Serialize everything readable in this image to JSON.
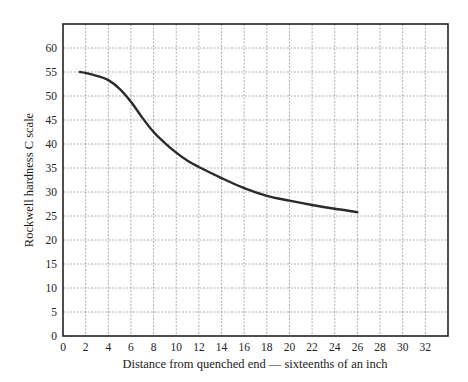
{
  "chart_data": {
    "type": "line",
    "title": "",
    "xlabel": "Distance from quenched end — sixteenths of an inch",
    "ylabel": "Rockwell hardness C scale",
    "xlim": [
      0,
      34
    ],
    "ylim": [
      0,
      65
    ],
    "x_ticks": [
      0,
      2,
      4,
      6,
      8,
      10,
      12,
      14,
      16,
      18,
      20,
      22,
      24,
      26,
      28,
      30,
      32
    ],
    "y_ticks": [
      0,
      5,
      10,
      15,
      20,
      25,
      30,
      35,
      40,
      45,
      50,
      55,
      60
    ],
    "grid": true,
    "legend": null,
    "series": [
      {
        "name": "Jominy hardness curve",
        "x": [
          1.5,
          2,
          3,
          4,
          5,
          6,
          7,
          8,
          9,
          10,
          11,
          12,
          14,
          16,
          18,
          20,
          22,
          24,
          26
        ],
        "y": [
          55,
          54.8,
          54.2,
          53.3,
          51.5,
          48.8,
          45.5,
          42.5,
          40.2,
          38.2,
          36.5,
          35.2,
          32.9,
          30.8,
          29.2,
          28.2,
          27.3,
          26.5,
          25.8
        ]
      }
    ]
  }
}
